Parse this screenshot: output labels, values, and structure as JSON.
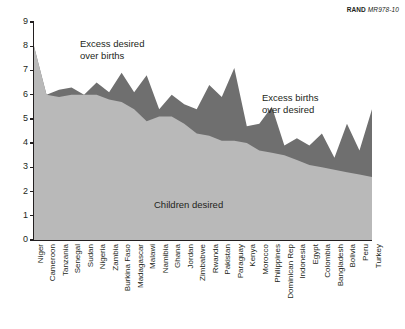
{
  "credit": {
    "publisher": "RAND",
    "document": "MR978-10"
  },
  "annotations": {
    "excess_desired_line1": "Excess desired",
    "excess_desired_line2": "over births",
    "excess_births_line1": "Excess births",
    "excess_births_line2": "over desired",
    "children_desired": "Children desired"
  },
  "colors": {
    "desired_fill": "#b9b9b9",
    "excess_fill": "#6f6f6f",
    "axis": "#231f20",
    "text": "#231f20",
    "background": "#ffffff"
  },
  "chart_data": {
    "type": "area",
    "title": "",
    "subtitle": "",
    "xlabel": "",
    "ylabel": "",
    "ylim": [
      0,
      9
    ],
    "yticks": [
      0,
      1,
      2,
      3,
      4,
      5,
      6,
      7,
      8,
      9
    ],
    "grid": false,
    "legend_position": "in-plot annotations",
    "categories": [
      "Niger",
      "Cameroon",
      "Tanzania",
      "Senegal",
      "Sudan",
      "Nigeria",
      "Zambia",
      "Burkina Faso",
      "Madagascar",
      "Malawi",
      "Namibia",
      "Ghana",
      "Jordan",
      "Zimbabwe",
      "Rwanda",
      "Pakistan",
      "Paraguay",
      "Kenya",
      "Morocco",
      "Philippines",
      "Dominican Rep",
      "Indonesia",
      "Egypt",
      "Colombia",
      "Bangladesh",
      "Bolivia",
      "Peru",
      "Turkey"
    ],
    "series": [
      {
        "name": "Children desired",
        "values": [
          8.0,
          6.0,
          5.9,
          6.0,
          6.0,
          6.0,
          5.8,
          5.7,
          5.4,
          4.9,
          5.1,
          5.1,
          4.8,
          4.4,
          4.3,
          4.1,
          4.1,
          4.0,
          3.7,
          3.6,
          3.5,
          3.3,
          3.1,
          3.0,
          2.9,
          2.8,
          2.7,
          2.6
        ]
      },
      {
        "name": "Total births",
        "values": [
          7.1,
          5.7,
          6.2,
          6.3,
          6.0,
          6.5,
          6.1,
          6.9,
          6.1,
          6.8,
          5.4,
          6.0,
          5.6,
          5.4,
          6.4,
          5.9,
          7.1,
          4.7,
          4.8,
          5.5,
          3.9,
          4.2,
          3.9,
          4.4,
          3.4,
          4.8,
          3.7,
          5.4
        ]
      }
    ],
    "regions": [
      {
        "name": "Excess desired over births",
        "fill": "#b9b9b9"
      },
      {
        "name": "Excess births over desired",
        "fill": "#6f6f6f"
      }
    ]
  }
}
